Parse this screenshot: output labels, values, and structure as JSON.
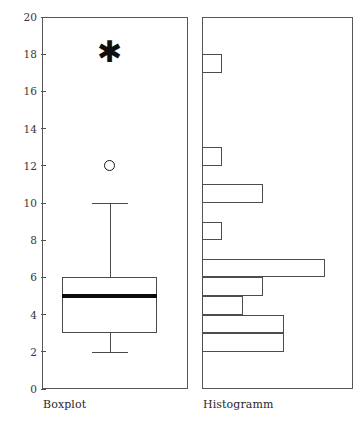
{
  "chart_data": [
    {
      "type": "box",
      "title": "",
      "xlabel": "Boxplot",
      "ylabel": "",
      "ylim": [
        0,
        20
      ],
      "yticks": [
        0,
        2,
        4,
        6,
        8,
        10,
        12,
        14,
        16,
        18,
        20
      ],
      "ytick_labels": [
        "0",
        "2",
        "4",
        "6",
        "8",
        "10",
        "12",
        "14",
        "16",
        "18",
        "20"
      ],
      "grid": false,
      "legend": "none",
      "box": {
        "q1": 3,
        "median": 5,
        "q3": 6,
        "whisker_low": 2,
        "whisker_high": 10
      },
      "outliers": [
        {
          "value": 12,
          "marker": "circle"
        },
        {
          "value": 18,
          "marker": "asterisk"
        }
      ]
    },
    {
      "type": "bar",
      "orientation": "horizontal",
      "title": "",
      "xlabel": "Histogramm",
      "ylabel": "",
      "ylim": [
        0,
        20
      ],
      "xlim": [
        0,
        7
      ],
      "grid": false,
      "legend": "none",
      "bin_width": 1,
      "bins": [
        {
          "bin_low": 2,
          "bin_high": 3,
          "count": 4
        },
        {
          "bin_low": 3,
          "bin_high": 4,
          "count": 4
        },
        {
          "bin_low": 4,
          "bin_high": 5,
          "count": 2
        },
        {
          "bin_low": 5,
          "bin_high": 6,
          "count": 3
        },
        {
          "bin_low": 6,
          "bin_high": 7,
          "count": 6
        },
        {
          "bin_low": 8,
          "bin_high": 9,
          "count": 1
        },
        {
          "bin_low": 10,
          "bin_high": 11,
          "count": 3
        },
        {
          "bin_low": 12,
          "bin_high": 13,
          "count": 1
        },
        {
          "bin_low": 17,
          "bin_high": 18,
          "count": 1
        }
      ],
      "categories": [
        "2-3",
        "3-4",
        "4-5",
        "5-6",
        "6-7",
        "8-9",
        "10-11",
        "12-13",
        "17-18"
      ],
      "values": [
        4,
        4,
        2,
        3,
        6,
        1,
        3,
        1,
        1
      ]
    }
  ],
  "axis": {
    "ticks": [
      "20",
      "18",
      "16",
      "14",
      "12",
      "10",
      "8",
      "6",
      "4",
      "2",
      "0"
    ],
    "min": 0,
    "max": 20
  },
  "captions": {
    "left": "Boxplot",
    "right": "Histogramm"
  },
  "marks": {
    "asterisk_glyph": "✱",
    "circle_glyph": "○"
  },
  "colors": {
    "line": "#5a5556",
    "median": "#0c0b0b",
    "text": "#2b2728",
    "background": "#ffffff"
  }
}
